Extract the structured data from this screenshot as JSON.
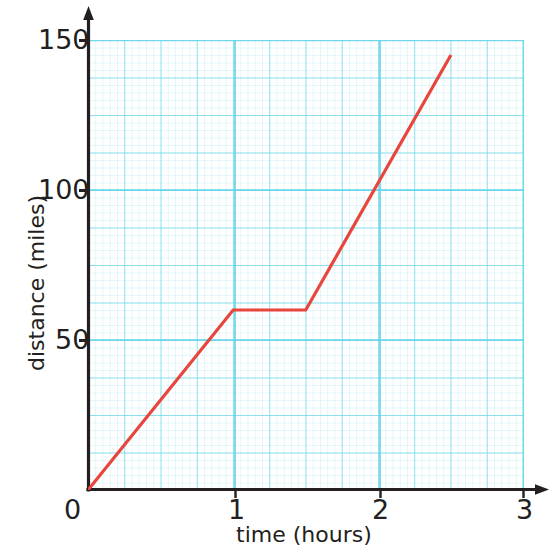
{
  "chart_data": {
    "type": "line",
    "title": "",
    "xlabel": "time (hours)",
    "ylabel": "distance (miles)",
    "xlim": [
      0,
      3
    ],
    "ylim": [
      0,
      150
    ],
    "xticks": [
      "0",
      "1",
      "2",
      "3"
    ],
    "xtick_values": [
      0,
      1,
      2,
      3
    ],
    "yticks": [
      "0",
      "50",
      "100",
      "150"
    ],
    "ytick_values": [
      0,
      50,
      100,
      150
    ],
    "grid": true,
    "grid_major_color": "#6fd8ea",
    "grid_minor_color": "#c3eef5",
    "axis_color": "#231f20",
    "legend": null,
    "series": [
      {
        "name": "journey",
        "color": "#e8453c",
        "x": [
          0,
          1,
          1.5,
          2.5
        ],
        "values": [
          0,
          60,
          60,
          145
        ],
        "points": [
          {
            "x": 0,
            "y": 0
          },
          {
            "x": 1,
            "y": 60
          },
          {
            "x": 1.5,
            "y": 60
          },
          {
            "x": 2.5,
            "y": 145
          }
        ]
      }
    ],
    "annotations": []
  },
  "axis": {
    "y_tick_150": "150",
    "y_tick_100": "100",
    "y_tick_50": "50",
    "x_tick_0": "0",
    "x_tick_1": "1",
    "x_tick_2": "2",
    "x_tick_3": "3",
    "y_title": "distance (miles)",
    "x_title": "time (hours)"
  }
}
